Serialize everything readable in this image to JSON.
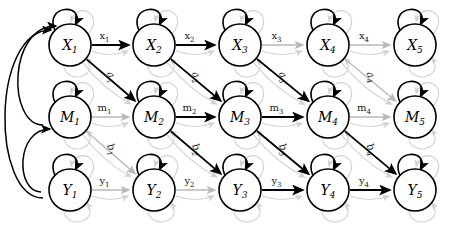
{
  "figure": {
    "type": "state-space-graph",
    "title": "",
    "width": 451,
    "height": 229,
    "background": "#ffffff"
  },
  "colors": {
    "node_stroke": "#000000",
    "node_fill": "#ffffff",
    "text": "#000000",
    "edge_dark": "#000000",
    "edge_mid": "#7d7d7d",
    "edge_light": "#b9b9b9",
    "edge_faint": "#d2d2d2"
  },
  "rows": [
    {
      "id": "X",
      "label_letter": "X",
      "y": 45
    },
    {
      "id": "M",
      "label_letter": "M",
      "y": 117
    },
    {
      "id": "Y",
      "label_letter": "Y",
      "y": 190
    }
  ],
  "columns": [
    {
      "index": 1,
      "x": 70
    },
    {
      "index": 2,
      "x": 154
    },
    {
      "index": 3,
      "x": 240
    },
    {
      "index": 4,
      "x": 328
    },
    {
      "index": 5,
      "x": 415
    }
  ],
  "nodes": [
    {
      "name": "X1",
      "letter": "X",
      "sub": "1",
      "row": "X",
      "col": 1,
      "cx": 70,
      "cy": 45,
      "r": 21
    },
    {
      "name": "X2",
      "letter": "X",
      "sub": "2",
      "row": "X",
      "col": 2,
      "cx": 154,
      "cy": 45,
      "r": 21
    },
    {
      "name": "X3",
      "letter": "X",
      "sub": "3",
      "row": "X",
      "col": 3,
      "cx": 240,
      "cy": 45,
      "r": 21
    },
    {
      "name": "X4",
      "letter": "X",
      "sub": "4",
      "row": "X",
      "col": 4,
      "cx": 328,
      "cy": 45,
      "r": 21
    },
    {
      "name": "X5",
      "letter": "X",
      "sub": "5",
      "row": "X",
      "col": 5,
      "cx": 415,
      "cy": 45,
      "r": 21
    },
    {
      "name": "M1",
      "letter": "M",
      "sub": "1",
      "row": "M",
      "col": 1,
      "cx": 70,
      "cy": 117,
      "r": 21
    },
    {
      "name": "M2",
      "letter": "M",
      "sub": "2",
      "row": "M",
      "col": 2,
      "cx": 154,
      "cy": 117,
      "r": 21
    },
    {
      "name": "M3",
      "letter": "M",
      "sub": "3",
      "row": "M",
      "col": 3,
      "cx": 240,
      "cy": 117,
      "r": 21
    },
    {
      "name": "M4",
      "letter": "M",
      "sub": "4",
      "row": "M",
      "col": 4,
      "cx": 328,
      "cy": 117,
      "r": 21
    },
    {
      "name": "M5",
      "letter": "M",
      "sub": "5",
      "row": "M",
      "col": 5,
      "cx": 415,
      "cy": 117,
      "r": 21
    },
    {
      "name": "Y1",
      "letter": "Y",
      "sub": "1",
      "row": "Y",
      "col": 1,
      "cx": 70,
      "cy": 190,
      "r": 21
    },
    {
      "name": "Y2",
      "letter": "Y",
      "sub": "2",
      "row": "Y",
      "col": 2,
      "cx": 154,
      "cy": 190,
      "r": 21
    },
    {
      "name": "Y3",
      "letter": "Y",
      "sub": "3",
      "row": "Y",
      "col": 3,
      "cx": 240,
      "cy": 190,
      "r": 21
    },
    {
      "name": "Y4",
      "letter": "Y",
      "sub": "4",
      "row": "Y",
      "col": 4,
      "cx": 328,
      "cy": 190,
      "r": 21
    },
    {
      "name": "Y5",
      "letter": "Y",
      "sub": "5",
      "row": "Y",
      "col": 5,
      "cx": 415,
      "cy": 190,
      "r": 21
    }
  ],
  "edges": [
    {
      "name": "x1",
      "from": "X1",
      "to": "X2",
      "label": "x",
      "sub": "1",
      "kind": "horizontal",
      "row": "X",
      "weight": "dark"
    },
    {
      "name": "x2",
      "from": "X2",
      "to": "X3",
      "label": "x",
      "sub": "2",
      "kind": "horizontal",
      "row": "X",
      "weight": "dark"
    },
    {
      "name": "x3",
      "from": "X3",
      "to": "X4",
      "label": "x",
      "sub": "3",
      "kind": "horizontal",
      "row": "X",
      "weight": "light"
    },
    {
      "name": "x4",
      "from": "X4",
      "to": "X5",
      "label": "x",
      "sub": "4",
      "kind": "horizontal",
      "row": "X",
      "weight": "light"
    },
    {
      "name": "m1",
      "from": "M1",
      "to": "M2",
      "label": "m",
      "sub": "1",
      "kind": "horizontal",
      "row": "M",
      "weight": "light"
    },
    {
      "name": "m2",
      "from": "M2",
      "to": "M3",
      "label": "m",
      "sub": "2",
      "kind": "horizontal",
      "row": "M",
      "weight": "dark"
    },
    {
      "name": "m3",
      "from": "M3",
      "to": "M4",
      "label": "m",
      "sub": "3",
      "kind": "horizontal",
      "row": "M",
      "weight": "dark"
    },
    {
      "name": "m4",
      "from": "M4",
      "to": "M5",
      "label": "m",
      "sub": "4",
      "kind": "horizontal",
      "row": "M",
      "weight": "light"
    },
    {
      "name": "y1",
      "from": "Y1",
      "to": "Y2",
      "label": "y",
      "sub": "1",
      "kind": "horizontal",
      "row": "Y",
      "weight": "light"
    },
    {
      "name": "y2",
      "from": "Y2",
      "to": "Y3",
      "label": "y",
      "sub": "2",
      "kind": "horizontal",
      "row": "Y",
      "weight": "light"
    },
    {
      "name": "y3",
      "from": "Y3",
      "to": "Y4",
      "label": "y",
      "sub": "3",
      "kind": "horizontal",
      "row": "Y",
      "weight": "dark"
    },
    {
      "name": "y4",
      "from": "Y4",
      "to": "Y5",
      "label": "y",
      "sub": "4",
      "kind": "horizontal",
      "row": "Y",
      "weight": "dark"
    },
    {
      "name": "a1",
      "from": "X1",
      "to": "M2",
      "label": "a",
      "sub": "1",
      "kind": "diagonal",
      "weight": "dark"
    },
    {
      "name": "a2",
      "from": "X2",
      "to": "M3",
      "label": "a",
      "sub": "2",
      "kind": "diagonal",
      "weight": "dark"
    },
    {
      "name": "a3",
      "from": "X3",
      "to": "M4",
      "label": "a",
      "sub": "3",
      "kind": "diagonal",
      "weight": "dark"
    },
    {
      "name": "a4",
      "from": "X4",
      "to": "M5",
      "label": "a",
      "sub": "4",
      "kind": "diagonal",
      "weight": "light"
    },
    {
      "name": "b1",
      "from": "M1",
      "to": "Y2",
      "label": "b",
      "sub": "1",
      "kind": "diagonal",
      "weight": "light"
    },
    {
      "name": "b2",
      "from": "M2",
      "to": "Y3",
      "label": "b",
      "sub": "2",
      "kind": "diagonal",
      "weight": "dark"
    },
    {
      "name": "b3",
      "from": "M3",
      "to": "Y4",
      "label": "b",
      "sub": "3",
      "kind": "diagonal",
      "weight": "dark"
    },
    {
      "name": "b4",
      "from": "M4",
      "to": "Y5",
      "label": "b",
      "sub": "4",
      "kind": "diagonal",
      "weight": "dark"
    }
  ],
  "self_loops": [
    {
      "name": "X1-self",
      "node": "X1",
      "weight": "dark"
    },
    {
      "name": "X2-self",
      "node": "X2",
      "weight": "dark"
    },
    {
      "name": "X3-self",
      "node": "X3",
      "weight": "dark"
    },
    {
      "name": "X4-self",
      "node": "X4",
      "weight": "dark"
    },
    {
      "name": "X5-self",
      "node": "X5",
      "weight": "dark"
    },
    {
      "name": "M1-self",
      "node": "M1",
      "weight": "dark"
    },
    {
      "name": "M2-self",
      "node": "M2",
      "weight": "dark"
    },
    {
      "name": "M3-self",
      "node": "M3",
      "weight": "dark"
    },
    {
      "name": "M4-self",
      "node": "M4",
      "weight": "dark"
    },
    {
      "name": "M5-self",
      "node": "M5",
      "weight": "dark"
    },
    {
      "name": "Y1-self",
      "node": "Y1",
      "weight": "dark"
    },
    {
      "name": "Y2-self",
      "node": "Y2",
      "weight": "dark"
    },
    {
      "name": "Y3-self",
      "node": "Y3",
      "weight": "dark"
    },
    {
      "name": "Y4-self",
      "node": "Y4",
      "weight": "dark"
    },
    {
      "name": "Y5-self",
      "node": "Y5",
      "weight": "dark"
    }
  ],
  "feedback_arcs": [
    {
      "name": "feedback-M1-to-X1",
      "from": "M1",
      "to": "X1",
      "weight": "dark"
    },
    {
      "name": "feedback-Y1-to-X1",
      "from": "Y1",
      "to": "X1",
      "weight": "dark"
    },
    {
      "name": "feedback-Y1-to-M1",
      "from": "Y1",
      "to": "M1",
      "weight": "dark"
    }
  ]
}
